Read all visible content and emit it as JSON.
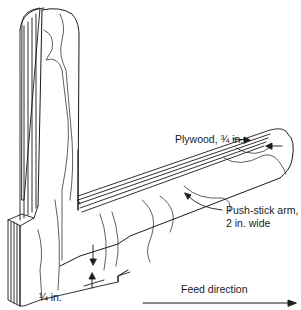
{
  "figure": {
    "colors": {
      "line": "#1a1a1a",
      "background": "#ffffff"
    }
  },
  "labels": {
    "plywood": "Plywood, ¾ in.",
    "arm_line1": "Push-stick arm,",
    "arm_line2": "2 in. wide",
    "notch": "¼ in.",
    "feed": "Feed direction"
  }
}
